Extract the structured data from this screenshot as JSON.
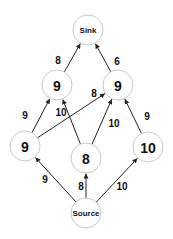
{
  "diagram": {
    "type": "flow-network",
    "nodes": [
      {
        "id": "sink",
        "label": "Sink",
        "x": 88,
        "y": 30,
        "r": 15,
        "kind": "terminal"
      },
      {
        "id": "upper_left",
        "label": "9",
        "x": 57,
        "y": 85,
        "r": 15,
        "kind": "value"
      },
      {
        "id": "upper_right",
        "label": "9",
        "x": 118,
        "y": 85,
        "r": 15,
        "kind": "value"
      },
      {
        "id": "left",
        "label": "9",
        "x": 25,
        "y": 146,
        "r": 15,
        "kind": "value"
      },
      {
        "id": "middle",
        "label": "8",
        "x": 86,
        "y": 158,
        "r": 15,
        "kind": "value"
      },
      {
        "id": "right",
        "label": "10",
        "x": 148,
        "y": 147,
        "r": 15,
        "kind": "value"
      },
      {
        "id": "source",
        "label": "Source",
        "x": 86,
        "y": 213,
        "r": 15,
        "kind": "terminal"
      }
    ],
    "edges": [
      {
        "from": "source",
        "to": "left",
        "label": "9",
        "lx": 45,
        "ly": 179
      },
      {
        "from": "source",
        "to": "middle",
        "label": "8",
        "lx": 81,
        "ly": 186
      },
      {
        "from": "source",
        "to": "right",
        "label": "10",
        "lx": 122,
        "ly": 186
      },
      {
        "from": "left",
        "to": "upper_left",
        "label": "9",
        "lx": 25,
        "ly": 115
      },
      {
        "from": "left",
        "to": "upper_right",
        "label": "8",
        "lx": 94,
        "ly": 93
      },
      {
        "from": "middle",
        "to": "upper_left",
        "label": "10",
        "lx": 61,
        "ly": 112
      },
      {
        "from": "middle",
        "to": "upper_right",
        "label": "10",
        "lx": 114,
        "ly": 123
      },
      {
        "from": "right",
        "to": "upper_right",
        "label": "9",
        "lx": 147,
        "ly": 116
      },
      {
        "from": "upper_left",
        "to": "sink",
        "label": "8",
        "lx": 58,
        "ly": 60
      },
      {
        "from": "upper_right",
        "to": "sink",
        "label": "6",
        "lx": 117,
        "ly": 61
      }
    ]
  }
}
